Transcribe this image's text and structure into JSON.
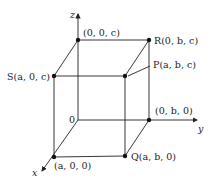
{
  "diagram": {
    "axes": {
      "x": "x",
      "y": "y",
      "z": "z",
      "origin": "0"
    },
    "points": {
      "top_origin": "(0, 0, c)",
      "R": "R(0, b, c)",
      "S": "S(a, 0, c)",
      "P": "P(a, b, c)",
      "y_point": "(0, b, 0)",
      "x_point": "(a, 0, 0)",
      "Q": "Q(a, b, 0)"
    },
    "colors": {
      "line": "#222222",
      "background": "#ffffff"
    }
  }
}
